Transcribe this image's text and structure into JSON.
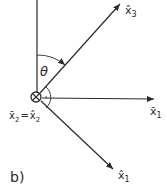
{
  "figure": {
    "panel_label": "b)",
    "angle_label": "θ",
    "colors": {
      "stroke": "#2a2a2a",
      "background": "#ffffff"
    },
    "origin": {
      "symbol": "circled-cross (into page)",
      "label_left": "x̄",
      "label_left_sub": "2",
      "equals": "=",
      "label_right": "x̂",
      "label_right_sub": "2"
    },
    "axes": [
      {
        "id": "vertical",
        "label": "",
        "arrow": false
      },
      {
        "id": "x3-hat",
        "label": "x̂",
        "sub": "3",
        "arrow": true
      },
      {
        "id": "x1-bar",
        "label": "x̄",
        "sub": "1",
        "arrow": true
      },
      {
        "id": "x1-hat",
        "label": "x̂",
        "sub": "1",
        "arrow": true
      }
    ]
  }
}
